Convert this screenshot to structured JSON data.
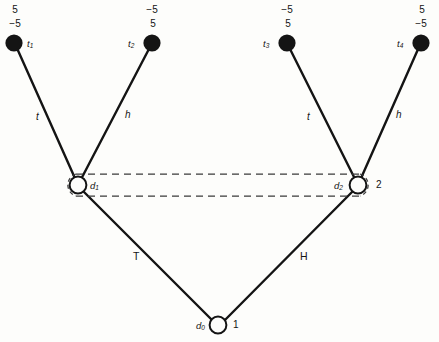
{
  "diagram": {
    "type": "game-tree",
    "background_color": "#fdfdfb",
    "line_color": "#141414",
    "terminal_nodes": [
      {
        "id": "t1",
        "label": "t",
        "subscript": "1",
        "value_top": "5",
        "value_bottom": "−5",
        "cx": 14,
        "cy": 43,
        "label_side": "right"
      },
      {
        "id": "t2",
        "label": "t",
        "subscript": "2",
        "value_top": "−5",
        "value_bottom": "5",
        "cx": 152,
        "cy": 43,
        "label_side": "left"
      },
      {
        "id": "t3",
        "label": "t",
        "subscript": "3",
        "value_top": "−5",
        "value_bottom": "5",
        "cx": 287,
        "cy": 43,
        "label_side": "left"
      },
      {
        "id": "t4",
        "label": "t",
        "subscript": "4",
        "value_top": "5",
        "value_bottom": "−5",
        "cx": 421,
        "cy": 43,
        "label_side": "left"
      }
    ],
    "decision_nodes": [
      {
        "id": "d1",
        "label": "d",
        "subscript": "1",
        "index": "",
        "cx": 78,
        "cy": 185,
        "label_side": "right"
      },
      {
        "id": "d2",
        "label": "d",
        "subscript": "2",
        "index": "2",
        "cx": 358,
        "cy": 185,
        "label_side": "left"
      },
      {
        "id": "d0",
        "label": "d",
        "subscript": "0",
        "index": "1",
        "cx": 218,
        "cy": 325,
        "label_side": "left"
      }
    ],
    "edges": [
      {
        "from": "d1",
        "to": "t1",
        "label": "t",
        "label_x": 36,
        "label_y": 112
      },
      {
        "from": "d1",
        "to": "t2",
        "label": "h",
        "label_x": 125,
        "label_y": 110
      },
      {
        "from": "d2",
        "to": "t3",
        "label": "t",
        "label_x": 307,
        "label_y": 112
      },
      {
        "from": "d2",
        "to": "t4",
        "label": "h",
        "label_x": 396,
        "label_y": 110
      },
      {
        "from": "d0",
        "to": "d1",
        "label": "T",
        "label_x": 133,
        "label_y": 251
      },
      {
        "from": "d0",
        "to": "d2",
        "label": "H",
        "label_x": 300,
        "label_y": 251
      }
    ],
    "information_sets": [
      {
        "from": "d1",
        "to": "d2",
        "style": "dashed",
        "description": "upper-dashed-link"
      },
      {
        "from": "d1",
        "to": "d2",
        "style": "dashed",
        "description": "lower-dashed-link"
      }
    ]
  }
}
